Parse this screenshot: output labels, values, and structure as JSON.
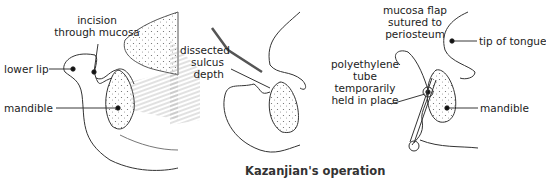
{
  "caption": "Kazanjian's operation",
  "panels": [
    {
      "id": "panel-1",
      "labels": {
        "incision_line1": "incision",
        "incision_line2": "through mucosa",
        "lower_lip": "lower lip",
        "mandible": "mandible"
      }
    },
    {
      "id": "panel-2",
      "labels": {
        "line1": "dissected",
        "line2": "sulcus",
        "line3": "depth"
      }
    },
    {
      "id": "panel-3",
      "labels": {
        "flap_line1": "mucosa flap",
        "flap_line2": "sutured to",
        "flap_line3": "periosteum",
        "tongue": "tip of tongue",
        "tube_line1": "polyethylene",
        "tube_line2": "tube",
        "tube_line3": "temporarily",
        "tube_line4": "held in place",
        "mandible": "mandible"
      }
    }
  ]
}
